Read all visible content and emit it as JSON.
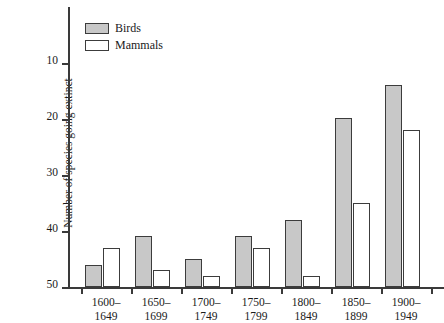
{
  "chart_data": {
    "type": "bar",
    "title": "",
    "xlabel": "",
    "ylabel": "Number of species going extinct",
    "ylim": [
      0,
      50
    ],
    "yticks": [
      10,
      20,
      30,
      40,
      50
    ],
    "grid": false,
    "legend_position": "top-left",
    "categories": [
      "1600–\n1649",
      "1650–\n1699",
      "1700–\n1749",
      "1750–\n1799",
      "1800–\n1849",
      "1850–\n1899",
      "1900–\n1949"
    ],
    "category_lines": [
      [
        "1600–",
        "1649"
      ],
      [
        "1650–",
        "1699"
      ],
      [
        "1700–",
        "1749"
      ],
      [
        "1750–",
        "1799"
      ],
      [
        "1800–",
        "1849"
      ],
      [
        "1850–",
        "1899"
      ],
      [
        "1900–",
        "1949"
      ]
    ],
    "series": [
      {
        "name": "Birds",
        "color": "#c8c8c8",
        "values": [
          4,
          9,
          5,
          9,
          12,
          30,
          36
        ]
      },
      {
        "name": "Mammals",
        "color": "#ffffff",
        "values": [
          7,
          3,
          2,
          7,
          2,
          15,
          28
        ]
      }
    ]
  },
  "legend": {
    "items": [
      {
        "label": "Birds"
      },
      {
        "label": "Mammals"
      }
    ]
  },
  "axes": {
    "y_label": "Number of species going extinct",
    "y_tick_labels": [
      "10",
      "20",
      "30",
      "40",
      "50"
    ]
  },
  "caption_fragments": {
    "lines": [
      "s",
      "t",
      "r-",
      "0",
      "son"
    ]
  },
  "colors": {
    "birds_fill": "#c8c8c8",
    "mammals_fill": "#ffffff",
    "outline": "#3c3c3c",
    "axis": "#3a3a3a",
    "text": "#1a1a1a",
    "background": "#ffffff"
  }
}
